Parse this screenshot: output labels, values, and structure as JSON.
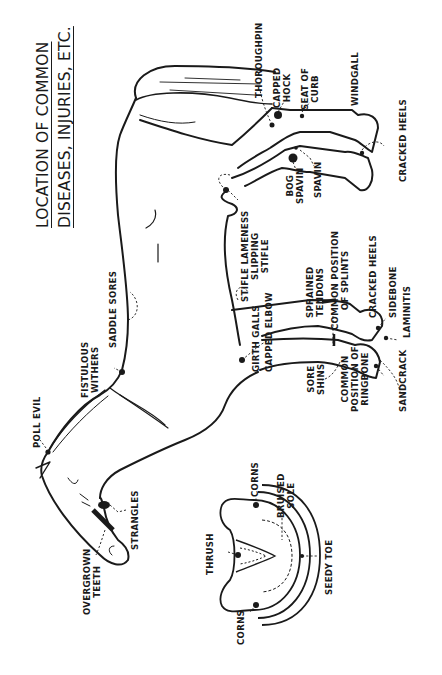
{
  "title": {
    "line1": "LOCATION OF COMMON",
    "line2": "DISEASES, INJURIES, ETC."
  },
  "orientation": "rotated 90° counter-clockwise",
  "labels": {
    "poll_evil": "POLL EVIL",
    "strangles": "STRANGLES",
    "overgrown_teeth": "OVERGROWN\nTEETH",
    "fistulous_withers": "FISTULOUS\nWITHERS",
    "saddle_sores": "SADDLE SORES",
    "girth_galls": "GIRTH GALLS",
    "capped_elbow": "CAPPED ELBOW",
    "stifle_lameness": "STIFLE LAMENESS\nSLIPPING\nSTIFLE",
    "sprained_tendons": "SPRAINED\nTENDONS",
    "common_position_of_splints": "COMMON POSITION\nOF SPLINTS",
    "cracked_heels_fore": "CRACKED HEELS",
    "sidebone": "SIDEBONE",
    "laminitis": "LAMINITIS",
    "sandcrack": "SANDCRACK",
    "common_position_of_ringbone": "COMMON\nPOSITION OF\nRINGBONE",
    "sore_shins": "SORE\nSHINS",
    "bog_spavin": "BOG\nSPAVIN",
    "spavin": "SPAVIN",
    "cracked_heels_hind": "CRACKED HEELS",
    "thoroughpin": "THOROUGHPIN",
    "capped_hock": "CAPPED\nHOCK",
    "seat_of_curb": "SEAT OF\nCURB",
    "windgall": "WINDGALL",
    "thrush": "THRUSH",
    "corns_top": "CORNS",
    "corns_bottom": "CORNS",
    "bruised_sole": "BRUISED\nSOLE",
    "seedy_toe": "SEEDY TOE"
  },
  "colors": {
    "ink": "#1a1a1a",
    "paper": "#ffffff"
  }
}
